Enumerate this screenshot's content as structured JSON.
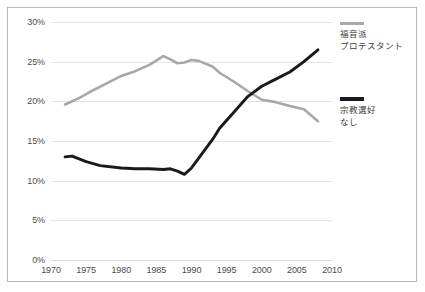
{
  "chart_data": {
    "type": "line",
    "title": "",
    "subtitle": "",
    "xlabel": "",
    "ylabel": "",
    "xlim": [
      1970,
      2010
    ],
    "ylim": [
      0,
      30
    ],
    "xticks": [
      "1970",
      "1975",
      "1980",
      "1985",
      "1990",
      "1995",
      "2000",
      "2005",
      "2010"
    ],
    "yticks": [
      "0%",
      "5%",
      "10%",
      "15%",
      "20%",
      "25%",
      "30%"
    ],
    "ytick_values": [
      0,
      5,
      10,
      15,
      20,
      25,
      30
    ],
    "xtick_values": [
      1970,
      1975,
      1980,
      1985,
      1990,
      1995,
      2000,
      2005,
      2010
    ],
    "grid": true,
    "legend_position": "right",
    "series": [
      {
        "name": "福音派\nプロテスタント",
        "name_line1": "福音派",
        "name_line2": "プロテスタント",
        "color": "#a8a8a8",
        "x": [
          1972,
          1974,
          1976,
          1978,
          1980,
          1982,
          1984,
          1986,
          1987,
          1988,
          1989,
          1990,
          1991,
          1993,
          1994,
          1996,
          1998,
          2000,
          2002,
          2004,
          2006,
          2008
        ],
        "values": [
          19.6,
          20.4,
          21.4,
          22.3,
          23.2,
          23.8,
          24.6,
          25.7,
          25.3,
          24.8,
          24.9,
          25.2,
          25.1,
          24.4,
          23.6,
          22.5,
          21.3,
          20.2,
          19.9,
          19.4,
          19.0,
          17.5
        ]
      },
      {
        "name": "宗教選好\nなし",
        "name_line1": "宗教選好",
        "name_line2": "なし",
        "color": "#1a1a1a",
        "x": [
          1972,
          1973,
          1975,
          1977,
          1980,
          1982,
          1984,
          1986,
          1987,
          1988,
          1989,
          1990,
          1991,
          1993,
          1994,
          1996,
          1998,
          2000,
          2002,
          2004,
          2006,
          2008
        ],
        "values": [
          13.0,
          13.1,
          12.4,
          11.9,
          11.6,
          11.5,
          11.5,
          11.4,
          11.5,
          11.2,
          10.8,
          11.6,
          12.8,
          15.2,
          16.6,
          18.6,
          20.6,
          21.9,
          22.8,
          23.7,
          25.0,
          26.5
        ]
      }
    ]
  },
  "legend": {
    "entries": [
      {
        "line1": "福音派",
        "line2": "プロテスタント"
      },
      {
        "line1": "宗教選好",
        "line2": "なし"
      }
    ]
  }
}
